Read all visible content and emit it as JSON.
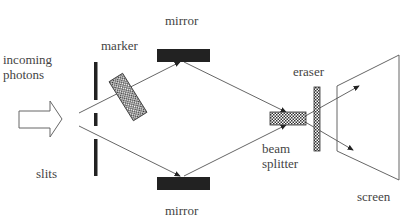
{
  "diagram": {
    "labels": {
      "incoming_line1": "incoming",
      "incoming_line2": "photons",
      "slits": "slits",
      "marker": "marker",
      "mirror_top": "mirror",
      "mirror_bottom": "mirror",
      "eraser": "eraser",
      "beam_line1": "beam",
      "beam_line2": "splitter",
      "screen": "screen"
    },
    "colors": {
      "ink": "#222222",
      "line": "#555555",
      "text": "#444444",
      "background": "#ffffff"
    }
  }
}
